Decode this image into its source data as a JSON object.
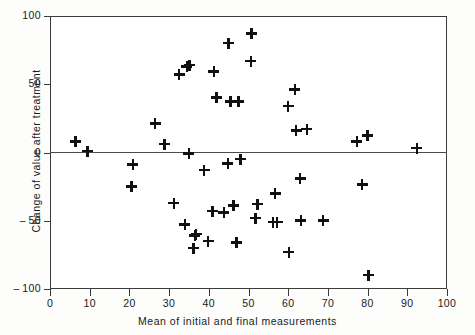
{
  "chart_data": {
    "type": "scatter",
    "title": "",
    "xlabel": "Mean of initial and final measurements",
    "ylabel": "Change of value after treatment",
    "xlim": [
      0,
      100
    ],
    "ylim": [
      -100,
      100
    ],
    "xticks": [
      0,
      10,
      20,
      30,
      40,
      50,
      60,
      70,
      80,
      90,
      100
    ],
    "yticks": [
      -100,
      -50,
      0,
      50,
      100
    ],
    "xtick_labels": [
      "0",
      "10",
      "20",
      "30",
      "40",
      "50",
      "60",
      "70",
      "80",
      "90",
      "100"
    ],
    "ytick_labels": [
      "-100",
      "-50",
      "0",
      "50",
      "100"
    ],
    "grid": false,
    "legend": false,
    "marker": "plus",
    "marker_color": "#111111",
    "reference_line": {
      "axis": "y",
      "value": 0
    },
    "points": [
      {
        "x": 6.5,
        "y": 8
      },
      {
        "x": 9.5,
        "y": 1
      },
      {
        "x": 20.9,
        "y": -9
      },
      {
        "x": 20.6,
        "y": -25
      },
      {
        "x": 26.5,
        "y": 21
      },
      {
        "x": 28.8,
        "y": 6
      },
      {
        "x": 31.2,
        "y": -37
      },
      {
        "x": 32.5,
        "y": 57
      },
      {
        "x": 34.5,
        "y": 63
      },
      {
        "x": 35.2,
        "y": 64
      },
      {
        "x": 34.0,
        "y": -53
      },
      {
        "x": 35.0,
        "y": -1
      },
      {
        "x": 36.5,
        "y": -61
      },
      {
        "x": 36.2,
        "y": -70
      },
      {
        "x": 36.8,
        "y": -60
      },
      {
        "x": 38.8,
        "y": -13
      },
      {
        "x": 39.8,
        "y": -65
      },
      {
        "x": 41.0,
        "y": -43
      },
      {
        "x": 41.3,
        "y": 59
      },
      {
        "x": 42.0,
        "y": 40
      },
      {
        "x": 43.8,
        "y": -44
      },
      {
        "x": 44.8,
        "y": -8
      },
      {
        "x": 45.0,
        "y": 80
      },
      {
        "x": 45.5,
        "y": 37
      },
      {
        "x": 46.3,
        "y": -39
      },
      {
        "x": 47.0,
        "y": -66
      },
      {
        "x": 47.5,
        "y": 37
      },
      {
        "x": 48.0,
        "y": -5
      },
      {
        "x": 50.8,
        "y": 87
      },
      {
        "x": 50.6,
        "y": 67
      },
      {
        "x": 52.3,
        "y": -38
      },
      {
        "x": 51.8,
        "y": -48
      },
      {
        "x": 56.7,
        "y": -30
      },
      {
        "x": 57.2,
        "y": -51
      },
      {
        "x": 56.2,
        "y": -51
      },
      {
        "x": 60.0,
        "y": 34
      },
      {
        "x": 60.2,
        "y": -73
      },
      {
        "x": 61.7,
        "y": 46
      },
      {
        "x": 62.0,
        "y": 16
      },
      {
        "x": 63.0,
        "y": -19
      },
      {
        "x": 63.2,
        "y": -50
      },
      {
        "x": 64.7,
        "y": 17
      },
      {
        "x": 68.8,
        "y": -50
      },
      {
        "x": 77.3,
        "y": 8
      },
      {
        "x": 78.6,
        "y": -23.5
      },
      {
        "x": 80.0,
        "y": 12.5
      },
      {
        "x": 80.2,
        "y": -90
      },
      {
        "x": 92.4,
        "y": 3
      }
    ]
  }
}
